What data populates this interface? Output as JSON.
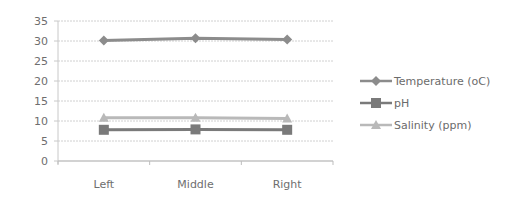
{
  "chart_data": {
    "type": "line",
    "title": "",
    "xlabel": "",
    "ylabel": "",
    "categories": [
      "Left",
      "Middle",
      "Right"
    ],
    "series": [
      {
        "name": "Temperature (oC)",
        "values": [
          30.1,
          30.7,
          30.4
        ],
        "color": "#8c8c8c",
        "marker": "diamond"
      },
      {
        "name": "pH",
        "values": [
          7.8,
          7.9,
          7.8
        ],
        "color": "#7a7a7a",
        "marker": "square"
      },
      {
        "name": "Salinity (ppm)",
        "values": [
          10.8,
          10.8,
          10.6
        ],
        "color": "#b9b9b9",
        "marker": "triangle"
      }
    ],
    "ylim": [
      0,
      35
    ],
    "yticks": [
      0,
      5,
      10,
      15,
      20,
      25,
      30,
      35
    ],
    "grid": true,
    "legend_position": "right"
  }
}
